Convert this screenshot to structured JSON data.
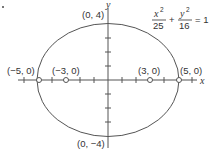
{
  "diagram": {
    "type": "ellipse",
    "equation": {
      "term1": {
        "numerator_var": "x",
        "numerator_exp": "2",
        "denominator": "25"
      },
      "plus": "+",
      "term2": {
        "numerator_var": "y",
        "numerator_exp": "2",
        "denominator": "16"
      },
      "equals": "= 1"
    },
    "axes": {
      "x_label": "x",
      "y_label": "y"
    },
    "semi_major": 5,
    "semi_minor": 4,
    "x_ticks": [
      -6,
      -5,
      -4,
      -3,
      -2,
      -1,
      1,
      2,
      3,
      4,
      5,
      6
    ],
    "y_ticks": [
      -4,
      -3,
      -2,
      -1,
      1,
      2,
      3,
      4
    ],
    "points": [
      {
        "label": "(−5, 0)",
        "x": -5,
        "y": 0,
        "kind": "vertex"
      },
      {
        "label": "(−3, 0)",
        "x": -3,
        "y": 0,
        "kind": "focus"
      },
      {
        "label": "(3, 0)",
        "x": 3,
        "y": 0,
        "kind": "focus"
      },
      {
        "label": "(5, 0)",
        "x": 5,
        "y": 0,
        "kind": "vertex"
      }
    ],
    "covertices": [
      {
        "label": "(0, 4)",
        "x": 0,
        "y": 4
      },
      {
        "label": "(0, −4)",
        "x": 0,
        "y": -4
      }
    ],
    "colors": {
      "stroke": "#555555",
      "text": "#333333",
      "background": "#ffffff"
    }
  }
}
